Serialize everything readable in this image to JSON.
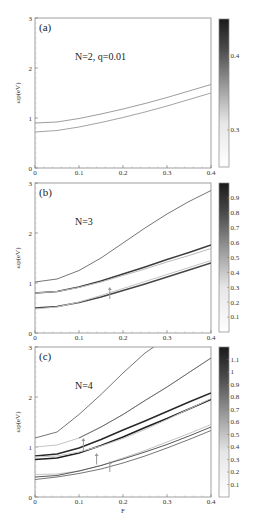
{
  "chart_data": [
    {
      "type": "line",
      "panel_label": "(a)",
      "annotation": "N=2,   q=0.01",
      "xlabel": "",
      "ylabel": "ωp(eV)",
      "xlim": [
        0,
        0.4
      ],
      "ylim": [
        0,
        3
      ],
      "xticks": [
        "0",
        "0.1",
        "0.2",
        "0.3",
        "0.4"
      ],
      "yticks": [
        "0",
        "1",
        "2",
        "3"
      ],
      "colorbar": {
        "min": 0.25,
        "max": 0.45,
        "ticks": [
          "0.4",
          "0.3"
        ]
      },
      "series": [
        {
          "name": "mode-1",
          "x": [
            0,
            0.05,
            0.1,
            0.15,
            0.2,
            0.25,
            0.3,
            0.35,
            0.4
          ],
          "values": [
            0.9,
            0.92,
            0.99,
            1.08,
            1.18,
            1.29,
            1.41,
            1.54,
            1.67
          ],
          "shade": 0.35
        },
        {
          "name": "mode-2",
          "x": [
            0,
            0.05,
            0.1,
            0.15,
            0.2,
            0.25,
            0.3,
            0.35,
            0.4
          ],
          "values": [
            0.72,
            0.75,
            0.82,
            0.91,
            1.01,
            1.12,
            1.24,
            1.37,
            1.5
          ],
          "shade": 0.32
        }
      ],
      "arrows": []
    },
    {
      "type": "line",
      "panel_label": "(b)",
      "annotation": "N=3",
      "xlabel": "",
      "ylabel": "ωp(eV)",
      "xlim": [
        0,
        0.4
      ],
      "ylim": [
        0,
        3
      ],
      "xticks": [
        "0",
        "0.1",
        "0.2",
        "0.3",
        "0.4"
      ],
      "yticks": [
        "0",
        "1",
        "2",
        "3"
      ],
      "colorbar": {
        "min": 0.0,
        "max": 1.0,
        "ticks": [
          "0.9",
          "0.8",
          "0.7",
          "0.6",
          "0.5",
          "0.4",
          "0.3",
          "0.2",
          "0.1"
        ]
      },
      "series": [
        {
          "name": "mode-1",
          "x": [
            0,
            0.05,
            0.1,
            0.15,
            0.2,
            0.25,
            0.3,
            0.35,
            0.4
          ],
          "values": [
            1.02,
            1.08,
            1.25,
            1.5,
            1.8,
            2.1,
            2.38,
            2.63,
            2.85
          ],
          "shade": 0.55
        },
        {
          "name": "mode-2",
          "x": [
            0,
            0.05,
            0.1,
            0.15,
            0.2,
            0.25,
            0.3,
            0.35,
            0.4
          ],
          "values": [
            0.8,
            0.83,
            0.92,
            1.04,
            1.18,
            1.32,
            1.47,
            1.61,
            1.76
          ],
          "shade": 0.85
        },
        {
          "name": "mode-3",
          "x": [
            0,
            0.05,
            0.1,
            0.15,
            0.2,
            0.25,
            0.3,
            0.35,
            0.4
          ],
          "values": [
            0.8,
            0.83,
            0.91,
            1.02,
            1.15,
            1.28,
            1.42,
            1.55,
            1.69
          ],
          "shade": 0.2
        },
        {
          "name": "mode-4",
          "x": [
            0,
            0.05,
            0.1,
            0.15,
            0.2,
            0.25,
            0.3,
            0.35,
            0.4
          ],
          "values": [
            0.5,
            0.53,
            0.61,
            0.72,
            0.85,
            0.98,
            1.12,
            1.26,
            1.4
          ],
          "shade": 0.8
        },
        {
          "name": "mode-5",
          "x": [
            0,
            0.05,
            0.1,
            0.15,
            0.2,
            0.25,
            0.3,
            0.35,
            0.4
          ],
          "values": [
            0.48,
            0.52,
            0.62,
            0.75,
            0.89,
            1.03,
            1.17,
            1.31,
            1.45
          ],
          "shade": 0.15
        }
      ],
      "arrows": [
        {
          "x": 0.17,
          "y0": 0.68,
          "y1": 0.92
        }
      ]
    },
    {
      "type": "line",
      "panel_label": "(c)",
      "annotation": "N=4",
      "xlabel": "F",
      "ylabel": "ωp(eV)",
      "xlim": [
        0,
        0.4
      ],
      "ylim": [
        0,
        3
      ],
      "xticks": [
        "0",
        "0.1",
        "0.2",
        "0.3",
        "0.4"
      ],
      "yticks": [
        "0",
        "1",
        "2",
        "3"
      ],
      "colorbar": {
        "min": 0.0,
        "max": 1.2,
        "ticks": [
          "1.1",
          "1",
          "0.9",
          "0.8",
          "0.7",
          "0.6",
          "0.5",
          "0.4",
          "0.3",
          "0.2",
          "0.1"
        ]
      },
      "series": [
        {
          "name": "mode-1",
          "x": [
            0,
            0.05,
            0.1,
            0.15,
            0.2,
            0.25,
            0.27
          ],
          "values": [
            1.18,
            1.3,
            1.65,
            2.05,
            2.48,
            2.88,
            3.0
          ],
          "shade": 0.55
        },
        {
          "name": "mode-2",
          "x": [
            0,
            0.05,
            0.1,
            0.15,
            0.2,
            0.25,
            0.3,
            0.35,
            0.4
          ],
          "values": [
            1.0,
            1.04,
            1.18,
            1.4,
            1.65,
            1.93,
            2.2,
            2.49,
            2.78
          ],
          "shade": 0.15
        },
        {
          "name": "mode-2b",
          "x": [
            0.1,
            0.15,
            0.2,
            0.25,
            0.3,
            0.35,
            0.4
          ],
          "values": [
            1.18,
            1.4,
            1.65,
            1.93,
            2.2,
            2.49,
            2.78
          ],
          "shade": 0.6
        },
        {
          "name": "mode-3",
          "x": [
            0,
            0.05,
            0.1,
            0.15,
            0.2,
            0.25,
            0.3,
            0.35,
            0.4
          ],
          "values": [
            0.82,
            0.86,
            0.98,
            1.15,
            1.34,
            1.52,
            1.71,
            1.9,
            2.08
          ],
          "shade": 0.95
        },
        {
          "name": "mode-4",
          "x": [
            0,
            0.05,
            0.1,
            0.15,
            0.2,
            0.25,
            0.3,
            0.35,
            0.4
          ],
          "values": [
            0.75,
            0.78,
            0.88,
            1.03,
            1.2,
            1.39,
            1.57,
            1.76,
            1.95
          ],
          "shade": 1.0
        },
        {
          "name": "mode-5",
          "x": [
            0,
            0.05,
            0.1,
            0.15,
            0.2,
            0.25,
            0.3,
            0.35,
            0.4
          ],
          "values": [
            0.8,
            0.82,
            0.9,
            1.02,
            1.17,
            1.35,
            1.55,
            1.76,
            1.97
          ],
          "shade": 0.15
        },
        {
          "name": "mode-6",
          "x": [
            0,
            0.05,
            0.1,
            0.15,
            0.2,
            0.25,
            0.3,
            0.35,
            0.4
          ],
          "values": [
            0.45,
            0.46,
            0.52,
            0.63,
            0.78,
            0.93,
            1.1,
            1.27,
            1.45
          ],
          "shade": 0.15
        },
        {
          "name": "mode-7",
          "x": [
            0,
            0.05,
            0.1,
            0.15,
            0.2,
            0.25,
            0.3,
            0.35,
            0.4
          ],
          "values": [
            0.4,
            0.43,
            0.52,
            0.63,
            0.76,
            0.9,
            1.05,
            1.22,
            1.4
          ],
          "shade": 0.7
        },
        {
          "name": "mode-8",
          "x": [
            0,
            0.05,
            0.1,
            0.15,
            0.2,
            0.25,
            0.3,
            0.35,
            0.4
          ],
          "values": [
            0.35,
            0.4,
            0.47,
            0.56,
            0.68,
            0.82,
            0.98,
            1.15,
            1.33
          ],
          "shade": 0.55
        }
      ],
      "arrows": [
        {
          "x": 0.11,
          "y0": 0.92,
          "y1": 1.18
        },
        {
          "x": 0.14,
          "y0": 0.65,
          "y1": 0.88
        },
        {
          "x": 0.17,
          "y0": 0.5,
          "y1": 0.72
        }
      ]
    }
  ],
  "layout": {
    "panels": [
      {
        "top": 18,
        "bottom": 168,
        "cb_top": 19,
        "cb_bottom": 167
      },
      {
        "top": 183,
        "bottom": 333,
        "cb_top": 183,
        "cb_bottom": 332
      },
      {
        "top": 347,
        "bottom": 497,
        "cb_top": 347,
        "cb_bottom": 497
      }
    ],
    "x_left": 35,
    "x_right": 211,
    "cb_left": 219,
    "cb_right": 229
  }
}
